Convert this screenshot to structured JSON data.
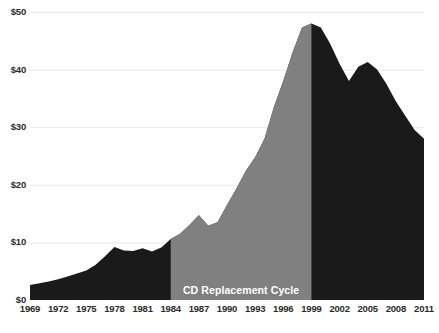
{
  "chart_data": {
    "type": "area",
    "title": "",
    "subtitle": "",
    "xlabel": "",
    "ylabel": "",
    "xlim": [
      1969,
      2011
    ],
    "ylim": [
      0,
      50
    ],
    "grid": true,
    "legend": "none",
    "y_tick_labels": [
      "$0",
      "$10",
      "$20",
      "$30",
      "$40",
      "$50"
    ],
    "y_tick_values": [
      0,
      10,
      20,
      30,
      40,
      50
    ],
    "x_tick_labels": [
      "1969",
      "1972",
      "1975",
      "1978",
      "1981",
      "1984",
      "1987",
      "1990",
      "1993",
      "1996",
      "1999",
      "2002",
      "2005",
      "2008",
      "2011"
    ],
    "x_tick_values": [
      1969,
      1972,
      1975,
      1978,
      1981,
      1984,
      1987,
      1990,
      1993,
      1996,
      1999,
      2002,
      2005,
      2008,
      2011
    ],
    "annotations": [
      {
        "text": "CD Replacement Cycle",
        "x_start": 1984,
        "x_end": 1999,
        "color": "#ffffff",
        "band_color": "#808080"
      }
    ],
    "series": [
      {
        "name": "Recorded music revenue per capita",
        "color": "#1a1a1a",
        "highlight_color": "#808080",
        "x": [
          1969,
          1970,
          1971,
          1972,
          1973,
          1974,
          1975,
          1976,
          1977,
          1978,
          1979,
          1980,
          1981,
          1982,
          1983,
          1984,
          1985,
          1986,
          1987,
          1988,
          1989,
          1990,
          1991,
          1992,
          1993,
          1994,
          1995,
          1996,
          1997,
          1998,
          1999,
          2000,
          2001,
          2002,
          2003,
          2004,
          2005,
          2006,
          2007,
          2008,
          2009,
          2010,
          2011
        ],
        "values": [
          2.6,
          2.9,
          3.2,
          3.6,
          4.1,
          4.6,
          5.1,
          6.1,
          7.6,
          9.2,
          8.6,
          8.5,
          9.0,
          8.4,
          9.1,
          10.6,
          11.5,
          13.0,
          14.7,
          12.9,
          13.5,
          16.5,
          19.3,
          22.4,
          24.8,
          28.0,
          33.5,
          38.0,
          43.0,
          47.3,
          48.0,
          47.3,
          44.5,
          41.0,
          38.0,
          40.5,
          41.3,
          40.0,
          37.5,
          34.5,
          32.0,
          29.5,
          28.0
        ]
      }
    ]
  },
  "axes": {
    "y_ticks": [
      {
        "label": "$50",
        "value": 50
      },
      {
        "label": "$40",
        "value": 40
      },
      {
        "label": "$30",
        "value": 30
      },
      {
        "label": "$20",
        "value": 20
      },
      {
        "label": "$10",
        "value": 10
      },
      {
        "label": "$0",
        "value": 0
      }
    ],
    "x_ticks": [
      {
        "label": "1969"
      },
      {
        "label": "1972"
      },
      {
        "label": "1975"
      },
      {
        "label": "1978"
      },
      {
        "label": "1981"
      },
      {
        "label": "1984"
      },
      {
        "label": "1987"
      },
      {
        "label": "1990"
      },
      {
        "label": "1993"
      },
      {
        "label": "1996"
      },
      {
        "label": "1999"
      },
      {
        "label": "2002"
      },
      {
        "label": "2005"
      },
      {
        "label": "2008"
      },
      {
        "label": "2011"
      }
    ]
  },
  "band": {
    "label": "CD Replacement Cycle"
  },
  "colors": {
    "area_dark": "#1a1a1a",
    "area_highlight": "#808080",
    "grid": "#e8e8e8",
    "text": "#2b2b2b",
    "band_text": "#ffffff",
    "background": "#ffffff"
  }
}
